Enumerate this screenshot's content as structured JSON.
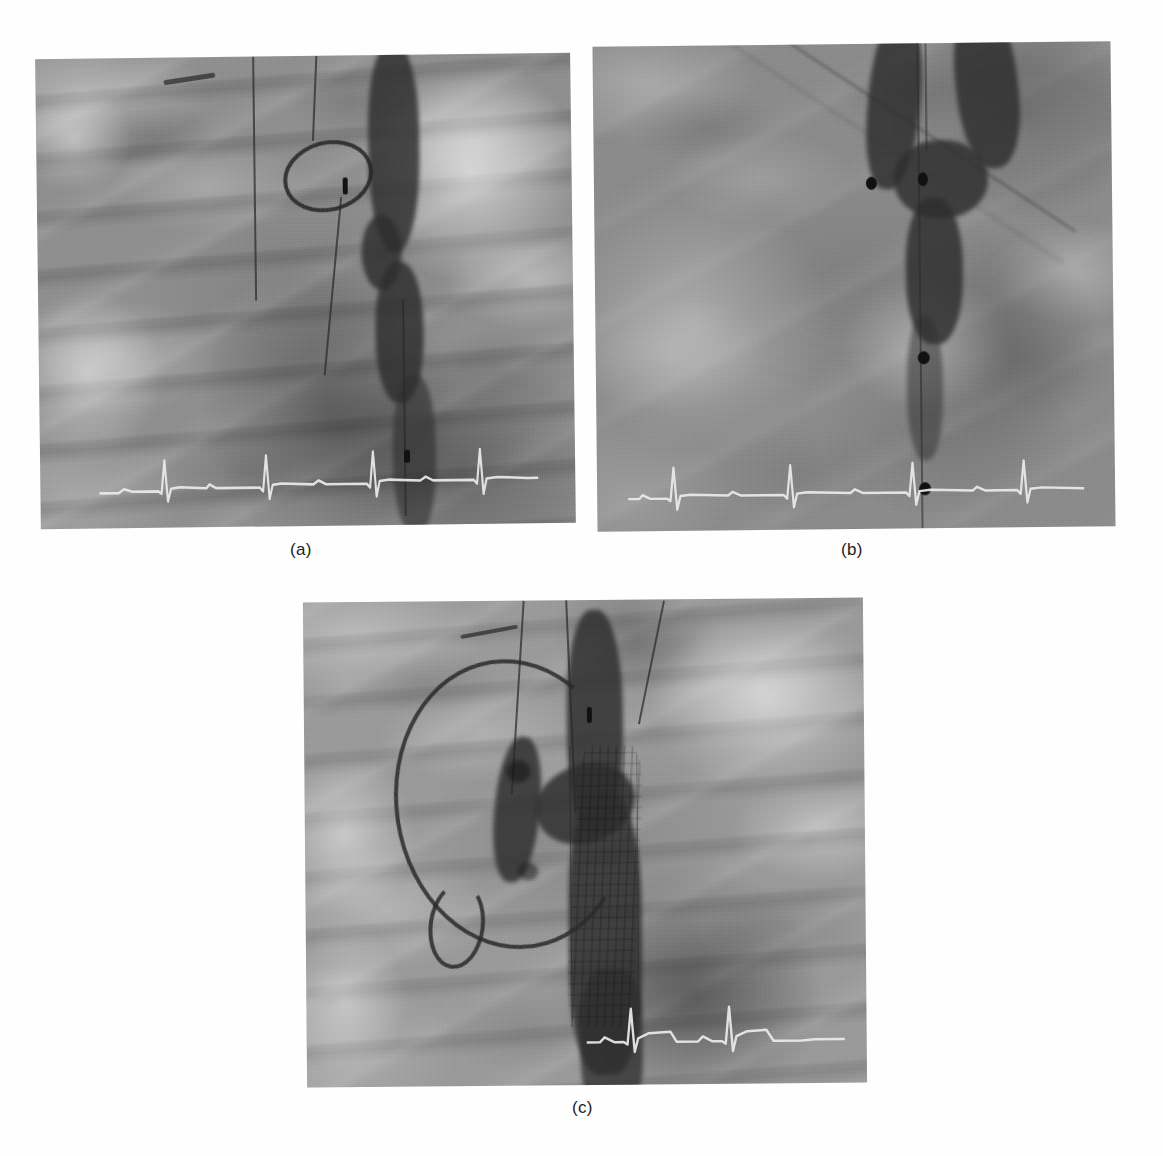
{
  "figure": {
    "kind": "medical-radiography-figure",
    "modality": "digital subtraction angiography / fluoroscopy",
    "panel_count": 3,
    "background_color": "#ffffff",
    "caption_color": "#1c1c1c"
  },
  "panels": [
    {
      "id": "a",
      "caption": "(a)",
      "position": {
        "x": 38,
        "y": 56,
        "width": 535,
        "height": 470
      },
      "tone": {
        "base": "#8f8f8f",
        "light": "#d9d9d9",
        "dark": "#3a3a3a"
      },
      "description": "Pre-procedure thoracic aortogram showing contrast-filled descending aorta with a pigtail catheter ring overlying the vertebral column",
      "features": [
        {
          "name": "contrast-filled-aorta",
          "kind": "vessel"
        },
        {
          "name": "catheter-ring-loop",
          "kind": "catheter"
        },
        {
          "name": "guidewire",
          "kind": "wire"
        },
        {
          "name": "radiopaque-marker",
          "kind": "marker"
        },
        {
          "name": "vertebral-bodies",
          "kind": "anatomy"
        },
        {
          "name": "ecg-trace",
          "kind": "overlay"
        }
      ],
      "ecg": {
        "present": true,
        "color": "#e8e8e8",
        "beats": 4,
        "label": "ecg-trace-panel-a"
      }
    },
    {
      "id": "b",
      "caption": "(b)",
      "position": {
        "x": 595,
        "y": 44,
        "width": 518,
        "height": 485
      },
      "tone": {
        "base": "#8b8b8b",
        "light": "#cfcfcf",
        "dark": "#333333"
      },
      "description": "Oblique fluoroscopic view of the aortic arch and descending aorta with a marker catheter in place; three dark radiopaque markers along the catheter",
      "features": [
        {
          "name": "aortic-arch-shadow",
          "kind": "vessel"
        },
        {
          "name": "marker-catheter",
          "kind": "catheter"
        },
        {
          "name": "radiopaque-marker",
          "kind": "marker"
        },
        {
          "name": "diaphragm-edge",
          "kind": "anatomy"
        },
        {
          "name": "ecg-trace",
          "kind": "overlay"
        }
      ],
      "ecg": {
        "present": true,
        "color": "#e8e8e8",
        "beats": 4,
        "label": "ecg-trace-panel-b"
      }
    },
    {
      "id": "c",
      "caption": "(c)",
      "position": {
        "x": 305,
        "y": 600,
        "width": 560,
        "height": 485
      },
      "tone": {
        "base": "#9a9a9a",
        "light": "#dcdcdc",
        "dark": "#3d3d3d"
      },
      "description": "Completion angiogram after thoracic endovascular aortic repair: pigtail catheter loop in the ascending aorta, deployed stent-graft in the descending thoracic aorta with visible strut pattern",
      "features": [
        {
          "name": "pigtail-catheter-loop",
          "kind": "catheter"
        },
        {
          "name": "deployed-stent-graft",
          "kind": "stent"
        },
        {
          "name": "contrast-filled-aorta",
          "kind": "vessel"
        },
        {
          "name": "guidewire",
          "kind": "wire"
        },
        {
          "name": "radiopaque-marker",
          "kind": "marker"
        },
        {
          "name": "vertebral-bodies",
          "kind": "anatomy"
        },
        {
          "name": "ecg-trace",
          "kind": "overlay"
        }
      ],
      "ecg": {
        "present": true,
        "color": "#e8e8e8",
        "beats": 3,
        "label": "ecg-trace-panel-c"
      }
    }
  ],
  "captions": {
    "a": "(a)",
    "b": "(b)",
    "c": "(c)"
  }
}
